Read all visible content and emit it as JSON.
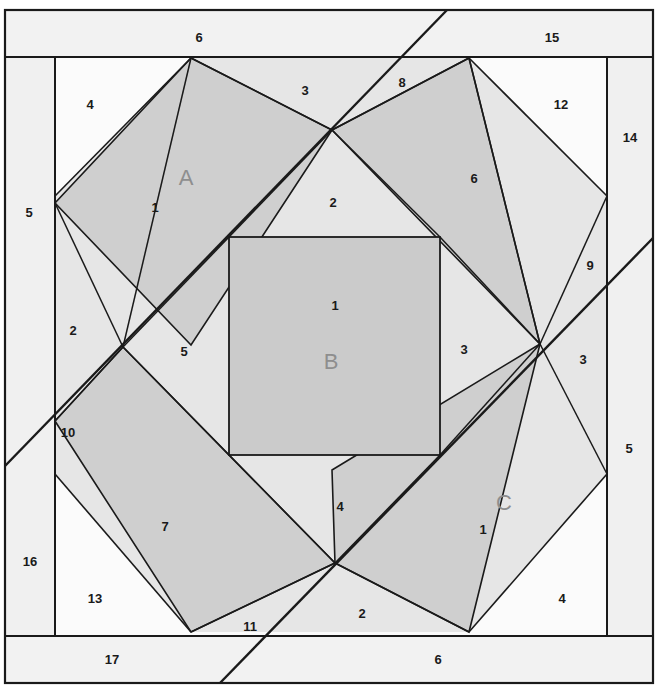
{
  "figure": {
    "background_color": "#ffffff",
    "stroke_color": "#1a1a1a",
    "colors": {
      "white_region": "#fbfbfb",
      "light_gray_region": "#ebebeb",
      "mid_gray_region": "#dadada",
      "dark_gray_region": "#c9c9c9",
      "band_gray": "#f2f2f2",
      "label_color": "#1a1a1a",
      "big_label_color": "#8e8e8e"
    }
  },
  "big_labels": [
    {
      "id": "rect-a",
      "text": "A",
      "x": 186,
      "y": 179
    },
    {
      "id": "square-b",
      "text": "B",
      "x": 331,
      "y": 363
    },
    {
      "id": "rect-c",
      "text": "C",
      "x": 504,
      "y": 504
    }
  ],
  "number_labels": [
    {
      "id": "n-top-band-6",
      "text": "6",
      "x": 199,
      "y": 39
    },
    {
      "id": "n-top-band-15",
      "text": "15",
      "x": 552,
      "y": 39
    },
    {
      "id": "n-top-left-4",
      "text": "4",
      "x": 90,
      "y": 106
    },
    {
      "id": "n-top-mid-3",
      "text": "3",
      "x": 305,
      "y": 92
    },
    {
      "id": "n-top-8",
      "text": "8",
      "x": 402,
      "y": 84
    },
    {
      "id": "n-top-right-12",
      "text": "12",
      "x": 561,
      "y": 106
    },
    {
      "id": "n-right-14",
      "text": "14",
      "x": 630,
      "y": 139
    },
    {
      "id": "n-left-5",
      "text": "5",
      "x": 29,
      "y": 214
    },
    {
      "id": "n-rect-a-1",
      "text": "1",
      "x": 155,
      "y": 209
    },
    {
      "id": "n-center-top-2",
      "text": "2",
      "x": 333,
      "y": 204
    },
    {
      "id": "n-rect-top-right-6",
      "text": "6",
      "x": 474,
      "y": 180
    },
    {
      "id": "n-right-9",
      "text": "9",
      "x": 590,
      "y": 267
    },
    {
      "id": "n-sq-b-1",
      "text": "1",
      "x": 335,
      "y": 307
    },
    {
      "id": "n-left-2",
      "text": "2",
      "x": 73,
      "y": 332
    },
    {
      "id": "n-center-left-5",
      "text": "5",
      "x": 184,
      "y": 353
    },
    {
      "id": "n-center-right-3",
      "text": "3",
      "x": 464,
      "y": 351
    },
    {
      "id": "n-right-3",
      "text": "3",
      "x": 583,
      "y": 361
    },
    {
      "id": "n-left-10",
      "text": "10",
      "x": 68,
      "y": 434
    },
    {
      "id": "n-right-5",
      "text": "5",
      "x": 629,
      "y": 450
    },
    {
      "id": "n-center-bottom-4",
      "text": "4",
      "x": 340,
      "y": 508
    },
    {
      "id": "n-rect-bottom-left-7",
      "text": "7",
      "x": 165,
      "y": 528
    },
    {
      "id": "n-rect-c-1",
      "text": "1",
      "x": 483,
      "y": 531
    },
    {
      "id": "n-left-16",
      "text": "16",
      "x": 30,
      "y": 563
    },
    {
      "id": "n-bottom-left-13",
      "text": "13",
      "x": 95,
      "y": 600
    },
    {
      "id": "n-bottom-11",
      "text": "11",
      "x": 250,
      "y": 628
    },
    {
      "id": "n-bottom-mid-2",
      "text": "2",
      "x": 362,
      "y": 615
    },
    {
      "id": "n-bottom-right-4",
      "text": "4",
      "x": 562,
      "y": 600
    },
    {
      "id": "n-bottom-band-17",
      "text": "17",
      "x": 112,
      "y": 661
    },
    {
      "id": "n-bottom-band-6",
      "text": "6",
      "x": 438,
      "y": 661
    }
  ],
  "shapes": {
    "outer_frame": {
      "x": 5,
      "y": 10,
      "w": 648,
      "h": 673
    },
    "inner_frame": {
      "x": 5,
      "y": 57,
      "w": 648,
      "h": 579
    },
    "inner_panel": {
      "x": 55,
      "y": 57,
      "w": 552,
      "h": 579
    },
    "square_b": {
      "x": 229,
      "y": 237,
      "w": 211,
      "h": 218
    },
    "octagon_points": "191,58 469,58 607,196 607,474 469,632 191,632 55,474 55,196",
    "rect_a_points": "191,58 332,130 191,345 55,203",
    "rect_top_right_points": "469,58 540,344 332,130",
    "rect_bottom_left_points": "123,347 335,563 191,632 55,421",
    "rect_c_points": "335,563 469,632 540,344 332,470",
    "diagonal_1": {
      "x1": 447,
      "y1": 10,
      "x2": 5,
      "y2": 466
    },
    "diagonal_2": {
      "x1": 653,
      "y1": 238,
      "x2": 220,
      "y2": 683
    }
  }
}
